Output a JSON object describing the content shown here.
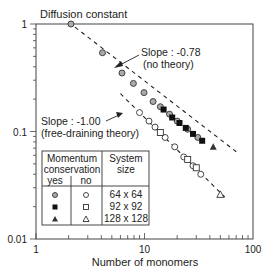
{
  "chart_data": {
    "type": "scatter",
    "title": "Diffusion constant",
    "xlabel": "Number of monomers",
    "ylabel": "Diffusion constant",
    "xscale": "log",
    "yscale": "log",
    "xlim": [
      1,
      100
    ],
    "ylim": [
      0.01,
      1
    ],
    "x_ticks": [
      {
        "v": 1,
        "label": "1"
      },
      {
        "v": 10,
        "label": "10"
      },
      {
        "v": 100,
        "label": "100"
      }
    ],
    "y_ticks": [
      {
        "v": 1,
        "label": "1"
      },
      {
        "v": 0.1,
        "label": "0.1"
      },
      {
        "v": 0.01,
        "label": "0.01"
      }
    ],
    "grid": false,
    "fit_lines": [
      {
        "name": "no theory",
        "slope": -0.78,
        "label_line1": "Slope : -0.78",
        "label_line2": "(no theory)",
        "x_range": [
          2.0,
          70
        ],
        "anchor": {
          "x": 2.1,
          "y": 1.0
        }
      },
      {
        "name": "free-draining theory",
        "slope": -1.0,
        "label_line1": "Slope : -1.00",
        "label_line2": "(free-draining theory)",
        "x_range": [
          6.0,
          55
        ],
        "anchor": {
          "x": 9.0,
          "y": 0.15
        }
      }
    ],
    "series": [
      {
        "name": "64 x 64, momentum conservation yes",
        "marker": "circle-gray",
        "points": [
          [
            2.1,
            1.0
          ],
          [
            4.1,
            0.54
          ],
          [
            6.2,
            0.35
          ],
          [
            7.9,
            0.28
          ],
          [
            9.9,
            0.23
          ],
          [
            12,
            0.19
          ],
          [
            14,
            0.17
          ],
          [
            17,
            0.145
          ],
          [
            20,
            0.125
          ],
          [
            25,
            0.105
          ],
          [
            31,
            0.088
          ]
        ]
      },
      {
        "name": "92 x 92, momentum conservation yes",
        "marker": "square-filled",
        "points": [
          [
            15,
            0.16
          ],
          [
            18,
            0.135
          ],
          [
            21,
            0.12
          ],
          [
            24,
            0.108
          ],
          [
            28,
            0.095
          ],
          [
            34,
            0.082
          ]
        ]
      },
      {
        "name": "128 x 128, momentum conservation yes",
        "marker": "triangle-filled",
        "points": [
          [
            43,
            0.072
          ]
        ]
      },
      {
        "name": "64 x 64, momentum conservation no",
        "marker": "circle-open",
        "points": [
          [
            9.0,
            0.15
          ],
          [
            11,
            0.125
          ],
          [
            12.5,
            0.11
          ],
          [
            15.5,
            0.088
          ],
          [
            19,
            0.072
          ],
          [
            23,
            0.058
          ],
          [
            28,
            0.048
          ],
          [
            33,
            0.04
          ]
        ]
      },
      {
        "name": "92 x 92, momentum conservation no",
        "marker": "square-open",
        "points": [
          [
            14,
            0.098
          ],
          [
            25,
            0.055
          ],
          [
            30,
            0.046
          ]
        ]
      },
      {
        "name": "128 x 128, momentum conservation no",
        "marker": "triangle-open",
        "points": [
          [
            50,
            0.026
          ]
        ]
      }
    ],
    "legend": {
      "position": "lower-left (inset table)",
      "header_momentum": "Momentum",
      "header_conservation": "conservation",
      "header_yes": "yes",
      "header_no": "no",
      "header_system": "System",
      "header_size": "size",
      "rows": [
        {
          "size": "64 x 64",
          "yes_marker": "circle-gray",
          "no_marker": "circle-open"
        },
        {
          "size": "92 x 92",
          "yes_marker": "square-filled",
          "no_marker": "square-open"
        },
        {
          "size": "128 x 128",
          "yes_marker": "triangle-filled",
          "no_marker": "triangle-open"
        }
      ]
    }
  }
}
